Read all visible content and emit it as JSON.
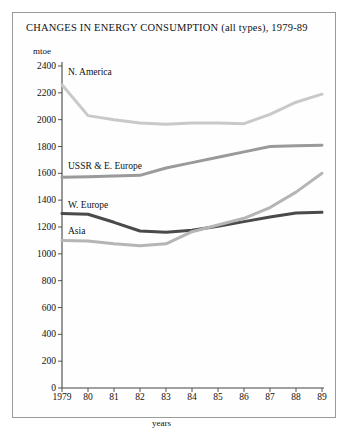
{
  "chart_data": {
    "type": "line",
    "title": "CHANGES IN ENERGY CONSUMPTION (all types), 1979-89",
    "ylabel": "mtoe",
    "xlabel": "years",
    "ylim": [
      0,
      2400
    ],
    "ytick_step": 200,
    "grid": false,
    "legend_position": "inline-labels",
    "yticks": [
      "2400",
      "2200",
      "2000",
      "1800",
      "1600",
      "1400",
      "1200",
      "1000",
      "800",
      "600",
      "400",
      "200",
      "0"
    ],
    "categories": [
      "1979",
      "80",
      "81",
      "82",
      "83",
      "84",
      "85",
      "86",
      "87",
      "88",
      "89"
    ],
    "series": [
      {
        "name": "N. America",
        "color": "#c9c9c9",
        "values": [
          2260,
          2030,
          2000,
          1975,
          1965,
          1975,
          1975,
          1970,
          2040,
          2130,
          2190
        ]
      },
      {
        "name": "USSR & E. Europe",
        "color": "#9a9a9a",
        "values": [
          1570,
          1575,
          1580,
          1585,
          1640,
          1680,
          1720,
          1760,
          1800,
          1805,
          1810
        ]
      },
      {
        "name": "W. Europe",
        "color": "#4a4a4a",
        "values": [
          1300,
          1295,
          1235,
          1170,
          1160,
          1175,
          1205,
          1240,
          1275,
          1305,
          1310
        ]
      },
      {
        "name": "Asia",
        "color": "#b5b5b5",
        "values": [
          1100,
          1095,
          1075,
          1060,
          1075,
          1165,
          1215,
          1265,
          1345,
          1460,
          1600
        ]
      }
    ]
  }
}
